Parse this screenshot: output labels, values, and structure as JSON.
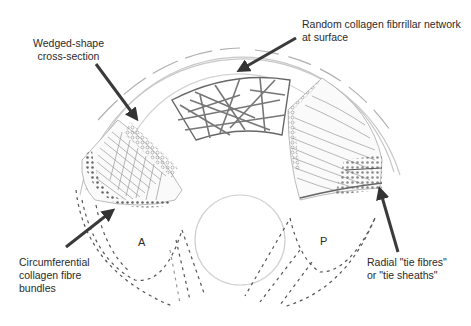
{
  "figure": {
    "colors": {
      "ink": "#2a2a2a",
      "sketch": "#8a8a8a",
      "light_sketch": "#c4c4c4",
      "arrow": "#3a3a3a",
      "background": "#ffffff"
    }
  },
  "labels": {
    "wedge": {
      "line1": "Wedged-shape",
      "line2": "cross-section"
    },
    "random": {
      "line1": "Random collagen fibrrillar network",
      "line2": "at surface"
    },
    "circumferential": {
      "line1": "Circumferential",
      "line2": "collagen fibre",
      "line3": "bundles"
    },
    "radial": {
      "line1": "Radial \"tie fibres\"",
      "line2": "or \"tie sheaths\""
    },
    "horn_anterior": "A",
    "horn_posterior": "P"
  },
  "arrows": [
    {
      "name": "wedge-arrow",
      "from": [
        95,
        63
      ],
      "to": [
        140,
        122
      ]
    },
    {
      "name": "surface-arrow",
      "from": [
        297,
        37
      ],
      "to": [
        234,
        73
      ]
    },
    {
      "name": "circumferential-arrow",
      "from": [
        67,
        248
      ],
      "to": [
        116,
        208
      ]
    },
    {
      "name": "radial-arrow",
      "from": [
        398,
        252
      ],
      "to": [
        378,
        186
      ]
    }
  ]
}
